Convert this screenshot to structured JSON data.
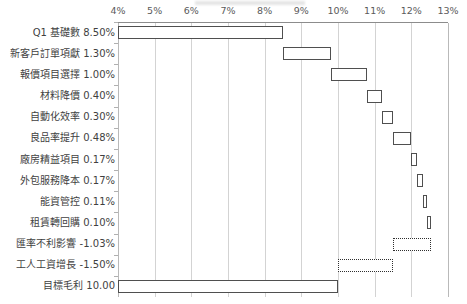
{
  "chart_data": {
    "type": "bar",
    "subtype": "waterfall",
    "title": "",
    "xlabel": "",
    "ylabel": "",
    "xlim": [
      4,
      13
    ],
    "xticks": [
      "4%",
      "5%",
      "6%",
      "7%",
      "8%",
      "9%",
      "10%",
      "11%",
      "12%",
      "13%"
    ],
    "xtick_values": [
      4,
      5,
      6,
      7,
      8,
      9,
      10,
      11,
      12,
      13
    ],
    "grid": true,
    "legend": "none",
    "orientation": "horizontal",
    "categories": [
      "Q1 基礎數 8.50%",
      "新客戶訂單項獻 1.30%",
      "報價項目選擇 1.00%",
      "材料降價 0.40%",
      "自動化效率 0.30%",
      "良品率提升 0.48%",
      "廠房精益項目 0.17%",
      "外包服務降本 0.17%",
      "能資管控 0.11%",
      "租賃轉回購 0.10%",
      "匯率不利影響 -1.03%",
      "工人工資增長 -1.50%",
      "目標毛利 10.00"
    ],
    "bars": [
      {
        "label": "Q1 基礎數 8.50%",
        "name": "Q1 基礎數",
        "value": 8.5,
        "start": 4.0,
        "end": 8.5,
        "kind": "total"
      },
      {
        "label": "新客戶訂單項獻 1.30%",
        "name": "新客戶訂單項獻",
        "value": 1.3,
        "start": 8.5,
        "end": 9.8,
        "kind": "positive"
      },
      {
        "label": "報價項目選擇 1.00%",
        "name": "報價項目選擇",
        "value": 1.0,
        "start": 9.8,
        "end": 10.8,
        "kind": "positive"
      },
      {
        "label": "材料降價 0.40%",
        "name": "材料降價",
        "value": 0.4,
        "start": 10.8,
        "end": 11.2,
        "kind": "positive"
      },
      {
        "label": "自動化效率 0.30%",
        "name": "自動化效率",
        "value": 0.3,
        "start": 11.2,
        "end": 11.5,
        "kind": "positive"
      },
      {
        "label": "良品率提升 0.48%",
        "name": "良品率提升",
        "value": 0.48,
        "start": 11.5,
        "end": 11.98,
        "kind": "positive"
      },
      {
        "label": "廠房精益項目 0.17%",
        "name": "廠房精益項目",
        "value": 0.17,
        "start": 11.98,
        "end": 12.15,
        "kind": "positive"
      },
      {
        "label": "外包服務降本 0.17%",
        "name": "外包服務降本",
        "value": 0.17,
        "start": 12.15,
        "end": 12.32,
        "kind": "positive"
      },
      {
        "label": "能資管控 0.11%",
        "name": "能資管控",
        "value": 0.11,
        "start": 12.32,
        "end": 12.43,
        "kind": "positive"
      },
      {
        "label": "租賃轉回購 0.10%",
        "name": "租賃轉回購",
        "value": 0.1,
        "start": 12.43,
        "end": 12.53,
        "kind": "positive"
      },
      {
        "label": "匯率不利影響 -1.03%",
        "name": "匯率不利影響",
        "value": -1.03,
        "start": 11.5,
        "end": 12.53,
        "kind": "negative"
      },
      {
        "label": "工人工資增長 -1.50%",
        "name": "工人工資增長",
        "value": -1.5,
        "start": 10.0,
        "end": 11.5,
        "kind": "negative"
      },
      {
        "label": "目標毛利 10.00",
        "name": "目標毛利",
        "value": 10.0,
        "start": 4.0,
        "end": 10.0,
        "kind": "total"
      }
    ],
    "colors": {
      "bar_fill": "#ffffff",
      "bar_border_positive": "#4f4f4f",
      "bar_border_negative": "#2f2f2f",
      "gridline": "#d3d3d3",
      "axis": "#8c8c8c",
      "text": "#3f3f3f"
    }
  }
}
